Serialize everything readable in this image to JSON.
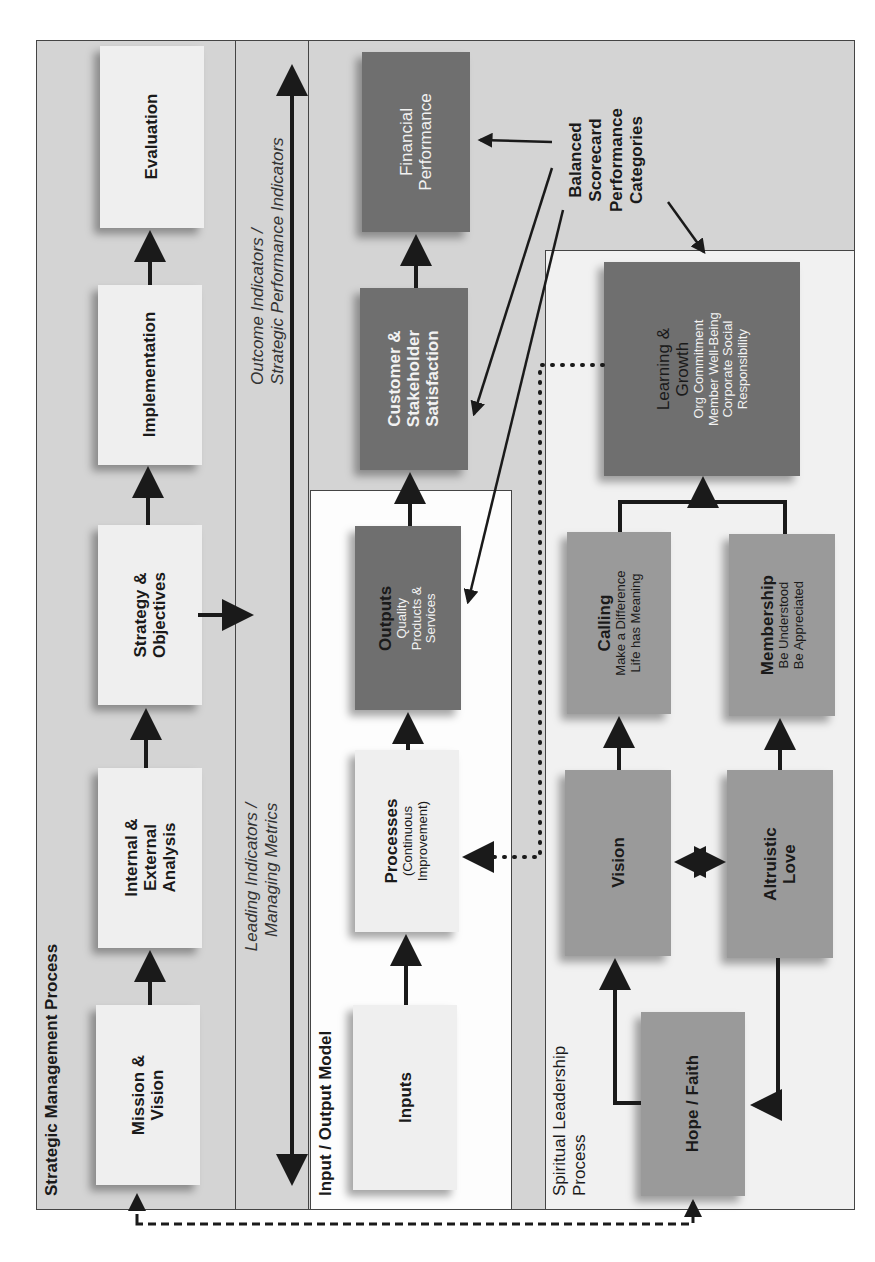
{
  "sections": {
    "strategic": {
      "title": "Strategic Management Process",
      "boxes": [
        {
          "label": "Mission &",
          "label2": "Vision"
        },
        {
          "label": "Internal &",
          "label2": "External",
          "label3": "Analysis"
        },
        {
          "label": "Strategy &",
          "label2": "Objectives"
        },
        {
          "label": "Implementation"
        },
        {
          "label": "Evaluation"
        }
      ]
    },
    "indicators": {
      "outcome_line1": "Outcome Indicators /",
      "outcome_line2": "Strategic Performance Indicators",
      "leading_line1": "Leading Indicators /",
      "leading_line2": "Managing Metrics"
    },
    "io_model": {
      "title": "Input / Output Model",
      "inputs": "Inputs",
      "processes": "Processes",
      "processes_sub1": "(Continuous",
      "processes_sub2": "Improvement)",
      "outputs": "Outputs",
      "outputs_sub1": "Quality",
      "outputs_sub2": "Products &",
      "outputs_sub3": "Services"
    },
    "performance": {
      "customer_l1": "Customer &",
      "customer_l2": "Stakeholder",
      "customer_l3": "Satisfaction",
      "financial_l1": "Financial",
      "financial_l2": "Performance"
    },
    "balanced_scorecard": {
      "l1": "Balanced",
      "l2": "Scorecard",
      "l3": "Performance",
      "l4": "Categories"
    },
    "spiritual": {
      "title_l1": "Spiritual Leadership",
      "title_l2": "Process",
      "hope": "Hope / Faith",
      "vision": "Vision",
      "altruistic_l1": "Altruistic",
      "altruistic_l2": "Love",
      "calling": "Calling",
      "calling_sub1": "Make a Difference",
      "calling_sub2": "Life has Meaning",
      "membership": "Membership",
      "membership_sub1": "Be Understood",
      "membership_sub2": "Be Appreciated",
      "learning_l1": "Learning &",
      "learning_l2": "Growth",
      "learning_sub1": "Org Commitment",
      "learning_sub2": "Member Well-Being",
      "learning_sub3": "Corporate Social",
      "learning_sub4": "Responsibility"
    }
  },
  "colors": {
    "band_grey": "#d4d4d4",
    "box_light": "#efefef",
    "box_mid": "#9a9a9a",
    "box_dark": "#6f6f6f",
    "line": "#1a1a1a"
  }
}
